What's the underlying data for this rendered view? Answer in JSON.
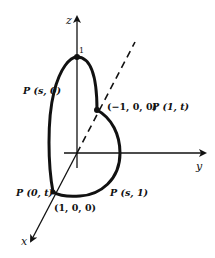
{
  "diagram": {
    "type": "3d-coordinate-parametric-curve",
    "stroke_color": "#111111",
    "background": "#ffffff",
    "axes": {
      "z": {
        "label": "z"
      },
      "y": {
        "label": "y"
      },
      "x": {
        "label": "x"
      }
    },
    "tick_labels": {
      "z_one": "1"
    },
    "points": [
      {
        "id": "top",
        "label": "1"
      },
      {
        "id": "neg-x",
        "coords": "(−1, 0, 0)",
        "param": "P (1, t)"
      },
      {
        "id": "pos-x",
        "coords": "(1, 0, 0)",
        "param": "P (0, t)"
      }
    ],
    "curve_labels": {
      "left_arc": "P (s, 0)",
      "bottom_arc": "P (s, 1)",
      "right_point": "P (1, t)",
      "left_point": "P (0, t)"
    },
    "coord_labels": {
      "neg_x": "(−1, 0, 0)",
      "pos_x": "(1, 0, 0)"
    }
  }
}
